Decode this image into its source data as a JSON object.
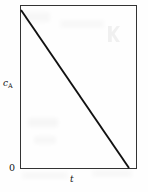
{
  "figure": {
    "name": "zero-order-concentration-vs-time-plot",
    "background_color": "#fefefe",
    "ink_color": "#111111",
    "width": 148,
    "height": 192
  },
  "labels": {
    "y_axis_symbol": "c",
    "y_axis_subscript": "A",
    "x_axis_symbol": "t",
    "origin": "0"
  },
  "chart_data": {
    "type": "line",
    "title": "",
    "subtitle": "",
    "xlabel": "t",
    "ylabel": "cA",
    "x": [
      0,
      1
    ],
    "series": [
      {
        "name": "cA",
        "x": [
          0,
          1
        ],
        "values": [
          1,
          0
        ]
      }
    ],
    "xlim": [
      0,
      1.075
    ],
    "ylim": [
      0,
      1.03
    ],
    "xticks": [],
    "yticks": [],
    "xticklabels": [
      "0"
    ],
    "yticklabels": [],
    "grid": false,
    "legend": false,
    "legend_position": "none",
    "annotations": [],
    "frame": {
      "left": 20.5,
      "right": 136.5,
      "top": 5.5,
      "bottom": 168.5,
      "stroke_color": "#333333",
      "stroke_width": 1
    },
    "line_geometry": {
      "x1": 21,
      "y1": 10,
      "x2": 129,
      "y2": 168,
      "stroke_color": "#111111",
      "stroke_width": 1.9
    }
  },
  "artifacts": [
    {
      "name": "watermark-k-glyph",
      "x": 108,
      "y": 26,
      "w": 12,
      "h": 16,
      "opacity": 0.055
    },
    {
      "name": "scan-smudge-upper-left",
      "x": 24,
      "y": 12,
      "w": 26,
      "h": 10,
      "opacity": 0.028
    },
    {
      "name": "scan-smudge-mid-left",
      "x": 28,
      "y": 118,
      "w": 30,
      "h": 9,
      "opacity": 0.03
    },
    {
      "name": "scan-smudge-lower-left",
      "x": 34,
      "y": 136,
      "w": 22,
      "h": 8,
      "opacity": 0.028
    },
    {
      "name": "scan-smudge-lower-band",
      "x": 22,
      "y": 172,
      "w": 46,
      "h": 7,
      "opacity": 0.025
    },
    {
      "name": "scan-smudge-right-band",
      "x": 92,
      "y": 170,
      "w": 40,
      "h": 7,
      "opacity": 0.022
    },
    {
      "name": "scan-smudge-top-band",
      "x": 60,
      "y": 20,
      "w": 44,
      "h": 8,
      "opacity": 0.022
    }
  ]
}
